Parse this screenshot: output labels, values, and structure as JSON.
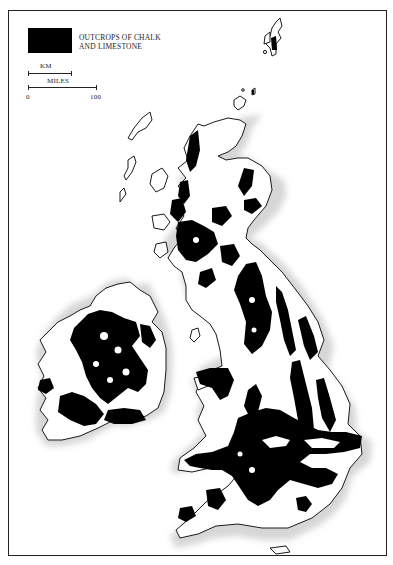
{
  "map": {
    "subject": "Britain and Ireland",
    "legend": {
      "swatch_color": "#000000",
      "label_line1": "OUTCROPS OF CHALK",
      "label_line2": "AND LIMESTONE"
    },
    "scale": {
      "km_label": "KM",
      "miles_label": "MILES",
      "tick_start": "0",
      "tick_end": "100"
    },
    "colors": {
      "land": "#ffffff",
      "outcrop": "#000000",
      "coast": "#1a1a1a",
      "sea_halo": "#d9d9d9"
    }
  }
}
